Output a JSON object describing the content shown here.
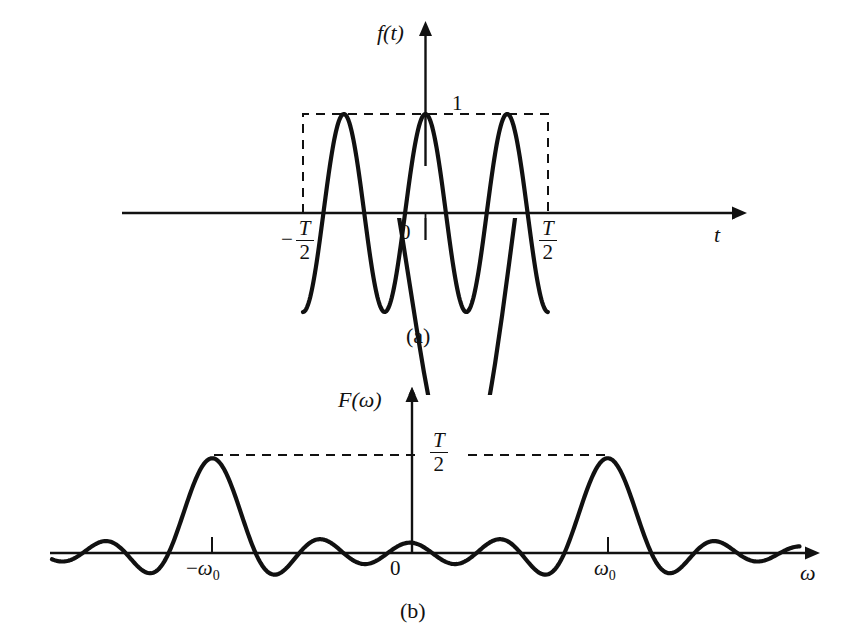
{
  "figure": {
    "background_color": "#ffffff",
    "ink_color": "#111111",
    "panels": [
      {
        "id": "a",
        "caption": "(a)",
        "y_axis_label": "f(t)",
        "x_axis_label": "t",
        "amplitude_label": "1",
        "origin_label": "0",
        "left_bound_label": {
          "sign": "−",
          "numerator": "T",
          "denominator": "2"
        },
        "right_bound_label": {
          "sign": "",
          "numerator": "T",
          "denominator": "2"
        },
        "envelope_style": "dashed-rectangle"
      },
      {
        "id": "b",
        "caption": "(b)",
        "y_axis_label": "F(ω)",
        "x_axis_label": "ω",
        "amplitude_label": {
          "numerator": "T",
          "denominator": "2"
        },
        "origin_label": "0",
        "left_peak_label": {
          "sign": "−",
          "base": "ω",
          "subscript": "0"
        },
        "right_peak_label": {
          "sign": "",
          "base": "ω",
          "subscript": "0"
        },
        "envelope_style": "dashed-level-line"
      }
    ]
  },
  "chart_data": [
    {
      "type": "line",
      "panel": "a",
      "title": "",
      "xlabel": "t",
      "ylabel": "f(t)",
      "description": "Truncated cosine pulse: f(t) = cos(w0*t) for |t| < T/2, zero elsewhere; dashed rectangle marks the gating window of height 1 spanning -T/2 to T/2",
      "xlim": [
        "-T/2 window shown inside an axis spanning beyond the pulse",
        ""
      ],
      "ylim": [
        -1,
        1
      ],
      "grid": false,
      "legend": false,
      "annotations": [
        "1",
        "0",
        "-T/2",
        "T/2"
      ],
      "x_ticks": [
        "-T/2",
        "0",
        "T/2"
      ],
      "y_ticks": [
        "1"
      ],
      "series": [
        {
          "name": "cos(w0 t) gated",
          "cycles_in_window": 3,
          "peak_value": 1,
          "trough_value": -1,
          "peaks_at": [
            "-T/2 + T/6 approx",
            "0",
            "T/2 - T/6 approx"
          ],
          "troughs": 2
        }
      ]
    },
    {
      "type": "line",
      "panel": "b",
      "title": "",
      "xlabel": "ω",
      "ylabel": "F(ω)",
      "description": "Spectrum of the gated cosine: F(w) = (T/2)[ sinc((w-w0)T/2) + sinc((w+w0)T/2) ], two sinc lobes centred at -w0 and +w0 with peak value T/2",
      "xlim": [
        "-∞",
        "+∞"
      ],
      "ylim": [
        -0.25,
        1.0
      ],
      "grid": false,
      "legend": false,
      "annotations": [
        "T/2",
        "0",
        "-ω₀",
        "ω₀"
      ],
      "x_ticks": [
        "-ω₀",
        "0",
        "ω₀"
      ],
      "y_ticks": [
        "T/2"
      ],
      "series": [
        {
          "name": "sinc pair",
          "peak_value_label": "T/2",
          "peak_positions": [
            "-ω₀",
            "ω₀"
          ],
          "main_lobe_count": 2,
          "side_lobes_per_side": 3,
          "value_at_zero": "approximately 0"
        }
      ]
    }
  ]
}
